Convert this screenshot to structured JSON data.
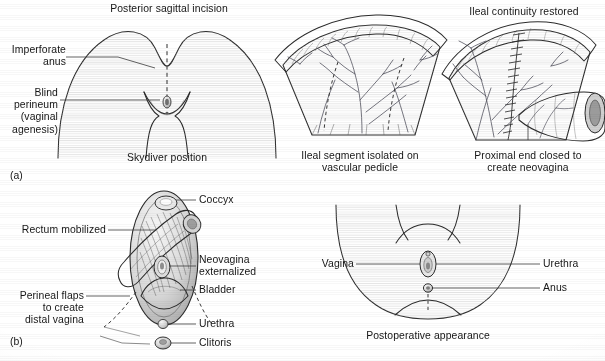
{
  "figure": {
    "domain": "anatomical-surgical-illustration",
    "panels": [
      {
        "id": "(a)",
        "title": "Posterior sagittal incision",
        "caption": "Skydiver position",
        "labels": [
          "Imperforate\nanus",
          "Blind\nperineum\n(vaginal\nagenesis)"
        ]
      },
      {
        "id": "",
        "title": "",
        "caption": "Ileal segment isolated on\nvascular pedicle",
        "labels": []
      },
      {
        "id": "",
        "title": "Ileal continuity restored",
        "caption": "Proximal end closed to\ncreate neovagina",
        "labels": []
      },
      {
        "id": "(b)",
        "title": "",
        "caption": "",
        "labels": [
          "Coccyx",
          "Rectum mobilized",
          "Neovagina\nexternalized",
          "Bladder",
          "Perineal flaps\nto create\ndistal vagina",
          "Urethra",
          "Clitoris"
        ]
      },
      {
        "id": "",
        "title": "",
        "caption": "Postoperative appearance",
        "labels": [
          "Vagina",
          "Urethra",
          "Anus"
        ]
      }
    ]
  },
  "panel_a": {
    "title": "Posterior sagittal incision",
    "caption": "Skydiver position",
    "label_imperforate_anus": "Imperforate\nanus",
    "label_blind_perineum": "Blind\nperineum\n(vaginal\nagenesis)",
    "panel_id": "(a)"
  },
  "panel_ileal_segment": {
    "caption_line1": "Ileal segment isolated on",
    "caption_line2": "vascular pedicle"
  },
  "panel_ileal_continuity": {
    "title": "Ileal continuity restored",
    "caption_line1": "Proximal end closed to",
    "caption_line2": "create neovagina"
  },
  "panel_b": {
    "panel_id": "(b)",
    "label_coccyx": "Coccyx",
    "label_rectum_mobilized": "Rectum mobilized",
    "label_neovagina_externalized": "Neovagina\nexternalized",
    "label_bladder": "Bladder",
    "label_perineal_flaps": "Perineal flaps\nto create\ndistal vagina",
    "label_urethra": "Urethra",
    "label_clitoris": "Clitoris"
  },
  "panel_postop": {
    "caption": "Postoperative appearance",
    "label_vagina": "Vagina",
    "label_urethra": "Urethra",
    "label_anus": "Anus"
  },
  "colors": {
    "background": "#ffffff",
    "text": "#161616",
    "outline": "#2b2b2b",
    "leader_line": "#3a3a3a",
    "tissue_fill_light": "#f2f2f2",
    "tissue_fill_mid": "#d8d8d8",
    "tissue_fill_dark": "#a8a8a8",
    "vessel": "#4a4a55",
    "dashed_incision": "#2f2f2f"
  }
}
